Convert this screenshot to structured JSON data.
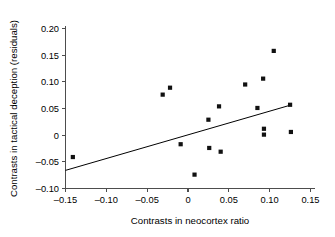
{
  "chart_data": {
    "type": "scatter",
    "title": "",
    "xlabel": "Contrasts in neocortex ratio",
    "ylabel": "Contrasts in tactical deception (residuals)",
    "xlim": [
      -0.16,
      0.155
    ],
    "ylim": [
      -0.105,
      0.205
    ],
    "xticks": [
      -0.15,
      -0.1,
      -0.05,
      0,
      0.05,
      0.1,
      0.15
    ],
    "xticklabels": [
      "–0.15",
      "–0.10",
      "–0.05",
      "0",
      "0.05",
      "0.10",
      "0.15"
    ],
    "yticks": [
      -0.1,
      -0.05,
      0,
      0.05,
      0.1,
      0.15,
      0.2
    ],
    "yticklabels": [
      "–0.10",
      "–0.05",
      "0",
      "0.05",
      "0.10",
      "0.15",
      "0.20"
    ],
    "grid": false,
    "legend": null,
    "marker": "filled-square",
    "marker_color": "#111111",
    "points": [
      {
        "x": -0.141,
        "y": -0.041
      },
      {
        "x": -0.031,
        "y": 0.076
      },
      {
        "x": -0.022,
        "y": 0.089
      },
      {
        "x": -0.009,
        "y": -0.017
      },
      {
        "x": 0.008,
        "y": -0.074
      },
      {
        "x": 0.025,
        "y": 0.029
      },
      {
        "x": 0.026,
        "y": -0.024
      },
      {
        "x": 0.038,
        "y": 0.054
      },
      {
        "x": 0.04,
        "y": -0.031
      },
      {
        "x": 0.07,
        "y": 0.095
      },
      {
        "x": 0.085,
        "y": 0.051
      },
      {
        "x": 0.092,
        "y": 0.106
      },
      {
        "x": 0.093,
        "y": 0.012
      },
      {
        "x": 0.093,
        "y": 0.001
      },
      {
        "x": 0.105,
        "y": 0.158
      },
      {
        "x": 0.125,
        "y": 0.057
      },
      {
        "x": 0.126,
        "y": 0.006
      }
    ],
    "trendline": {
      "type": "linear-fit",
      "x_start": -0.15,
      "y_start": -0.066,
      "x_end": 0.127,
      "y_end": 0.057
    }
  }
}
